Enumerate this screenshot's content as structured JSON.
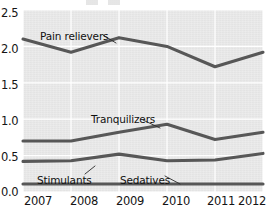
{
  "chart_data": {
    "type": "line",
    "title": "",
    "subtitle": "",
    "xlabel": "",
    "ylabel": "",
    "x": [
      "2007",
      "2008",
      "2009",
      "2010",
      "2011",
      "2012"
    ],
    "categories": [
      "2007",
      "2008",
      "2009",
      "2010",
      "2011",
      "2012"
    ],
    "xticklabels": [
      "2007",
      "2008",
      "2009",
      "2010",
      "2011",
      "2012"
    ],
    "yticklabels": [
      "0.0",
      "0.5",
      "1.0",
      "1.5",
      "2.0",
      "2.5"
    ],
    "yticks": [
      0.0,
      0.5,
      1.0,
      1.5,
      2.0,
      2.5
    ],
    "ylim": [
      0.0,
      2.5
    ],
    "grid": "both",
    "legend": "inline-annotations",
    "series": [
      {
        "name": "Pain relievers",
        "values": [
          2.1,
          1.92,
          2.12,
          2.0,
          1.72,
          1.92
        ]
      },
      {
        "name": "Tranquilizers",
        "values": [
          0.7,
          0.7,
          0.82,
          0.93,
          0.72,
          0.82
        ]
      },
      {
        "name": "Stimulants",
        "values": [
          0.42,
          0.43,
          0.52,
          0.43,
          0.44,
          0.53
        ]
      },
      {
        "name": "Sedatives",
        "values": [
          0.11,
          0.11,
          0.11,
          0.11,
          0.11,
          0.11
        ]
      }
    ],
    "annotations": [
      {
        "text": "Pain relievers",
        "x": 40,
        "y": 31
      },
      {
        "text": "Tranquilizers",
        "x": 91,
        "y": 114
      },
      {
        "text": "Stimulants",
        "x": 37,
        "y": 175
      },
      {
        "text": "Sedatives",
        "x": 120,
        "y": 175
      }
    ]
  },
  "colors": {
    "line": "#575757",
    "plot_background": "#e9e9e9",
    "gridline": "#ffffff",
    "text": "#141414",
    "page_background": "#ffffff"
  }
}
